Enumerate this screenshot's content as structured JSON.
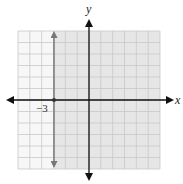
{
  "chart_data": {
    "type": "inequality-graph",
    "title": "",
    "xlabel": "x",
    "ylabel": "y",
    "xlim": [
      -6,
      6
    ],
    "ylim": [
      -6,
      6
    ],
    "grid": true,
    "grid_step": 1,
    "boundary": {
      "equation": "x = -3",
      "style": "solid",
      "color": "#777777"
    },
    "shaded_region": {
      "description": "x >= -3",
      "side": "right",
      "color": "#e6e6e6"
    },
    "annotations": [
      {
        "text": "−3",
        "x": -3,
        "y": 0
      }
    ]
  },
  "labels": {
    "x_axis": "x",
    "y_axis": "y",
    "tick_neg3": "−3"
  },
  "colors": {
    "shade": "#e6e6e6",
    "grid": "#c8c8c8",
    "axis": "#111111",
    "boundary": "#777777"
  }
}
